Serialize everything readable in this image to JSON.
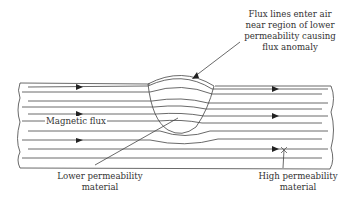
{
  "diagram": {
    "type": "magnetic flux leakage schematic",
    "labels": {
      "flux_anomaly": [
        "Flux lines enter air",
        "near region of lower",
        "permeability causing",
        "flux anomaly"
      ],
      "magnetic_flux": "Magnetic flux",
      "lower_permeability": [
        "Lower permeability",
        "material"
      ],
      "high_permeability": [
        "High permeability",
        "material"
      ]
    },
    "colors": {
      "line": "#444444",
      "text": "#333333",
      "background": "#ffffff"
    },
    "flux_line_count": 10,
    "arrow_direction": "right"
  }
}
